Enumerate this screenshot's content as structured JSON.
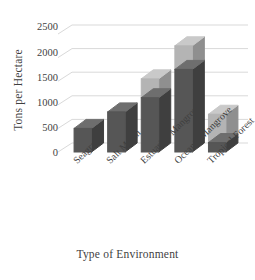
{
  "chart_data": {
    "type": "bar",
    "title": "",
    "subtitle": "",
    "xlabel": "Type of Environment",
    "ylabel": "Tons per Hectare",
    "categories": [
      "Seagrass",
      "Salt Marsh",
      "Estuarine Mangrove",
      "Oceanic Mangrove",
      "Tropical Forest"
    ],
    "stacked": true,
    "series": [
      {
        "name": "lower-segment",
        "color": "#565656",
        "values": [
          500,
          850,
          1150,
          1750,
          200
        ]
      },
      {
        "name": "upper-segment",
        "color": "#b4b4b4",
        "values": [
          0,
          0,
          400,
          500,
          600
        ]
      }
    ],
    "totals": [
      500,
      850,
      1550,
      2250,
      800
    ],
    "ylim": [
      0,
      2500
    ],
    "yticks": [
      0,
      500,
      1000,
      1500,
      2000,
      2500
    ],
    "ytick_labels": [
      "0",
      "500",
      "1000",
      "1500",
      "2000",
      "2500"
    ],
    "grid": true,
    "grid_axis": "y",
    "legend": "none",
    "style": "3d-column"
  },
  "axes": {
    "y_title": "Tons per Hectare",
    "x_title": "Type of Environment",
    "y_tick_labels": [
      "2500",
      "2000",
      "1500",
      "1000",
      "500",
      "0"
    ]
  },
  "colors": {
    "bar_dark": "#565656",
    "bar_light": "#b4b4b4",
    "bar_dark_side": "#3f3f3f",
    "bar_light_side": "#8f8f8f",
    "bar_dark_top": "#6e6e6e",
    "bar_light_top": "#c9c9c9",
    "gridline": "#d9d9d9",
    "text": "#3f3f3f",
    "background": "#ffffff"
  },
  "category_labels": [
    "Seagrass",
    "Salt Marsh",
    "Estuarine Mangrove",
    "Oceanic Mangrove",
    "Tropical Forest"
  ]
}
